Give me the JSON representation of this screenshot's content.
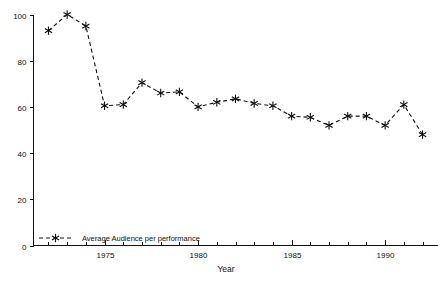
{
  "chart_data": {
    "type": "line",
    "title": "",
    "xlabel": "Year",
    "ylabel": "",
    "xlim": [
      1971.2,
      1992.8
    ],
    "ylim": [
      0,
      100
    ],
    "grid": false,
    "legend_position": "inside-bottom-left",
    "x_major_ticks": [
      1975,
      1980,
      1985,
      1990
    ],
    "x_major_tick_labels": [
      "1975",
      "1980",
      "1985",
      "1990"
    ],
    "x_minor_ticks": [
      1972,
      1973,
      1974,
      1976,
      1977,
      1978,
      1979,
      1981,
      1982,
      1983,
      1984,
      1986,
      1987,
      1988,
      1989,
      1991,
      1992
    ],
    "y_ticks": [
      0,
      20,
      40,
      60,
      80,
      100
    ],
    "y_tick_labels": [
      "0",
      "20",
      "40",
      "60",
      "80",
      "100"
    ],
    "x": [
      1972,
      1973,
      1974,
      1975,
      1976,
      1977,
      1978,
      1979,
      1980,
      1981,
      1982,
      1983,
      1984,
      1985,
      1986,
      1987,
      1988,
      1989,
      1990,
      1991,
      1992
    ],
    "series": [
      {
        "name": "Average Audience per performance",
        "marker": "asterisk",
        "linestyle": "dashed",
        "color": "#111111",
        "values": [
          93,
          100,
          95,
          60.5,
          61,
          70.5,
          66,
          66.5,
          60,
          62,
          63.5,
          61.5,
          60.5,
          56,
          55.5,
          52,
          56,
          56,
          52,
          61,
          48
        ]
      }
    ]
  },
  "legend": {
    "entries": [
      {
        "label": "Average Audience per performance"
      }
    ]
  },
  "axes": {
    "x_title": "Year"
  }
}
